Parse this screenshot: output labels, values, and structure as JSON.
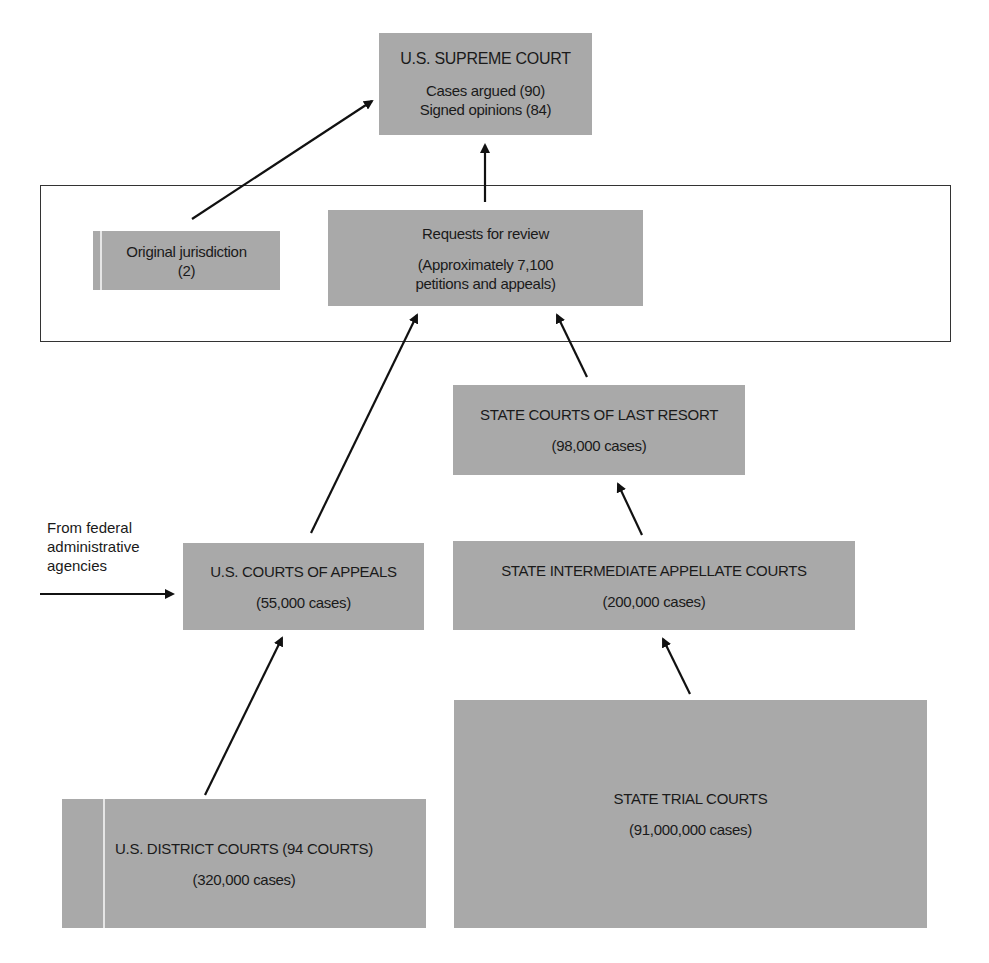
{
  "diagram": {
    "type": "flowchart",
    "nodes": {
      "supreme_court": {
        "title": "U.S. SUPREME COURT",
        "line1": "Cases argued (90)",
        "line2": "Signed opinions (84)"
      },
      "original_jurisdiction": {
        "title": "Original jurisdiction",
        "line1": "(2)"
      },
      "requests_for_review": {
        "title": "Requests for review",
        "line1": "(Approximately 7,100",
        "line2": "petitions and appeals)"
      },
      "state_last_resort": {
        "title": "STATE COURTS OF LAST RESORT",
        "line1": "(98,000 cases)"
      },
      "courts_of_appeals": {
        "title": "U.S. COURTS OF APPEALS",
        "line1": "(55,000 cases)"
      },
      "state_intermediate": {
        "title": "STATE INTERMEDIATE APPELLATE COURTS",
        "line1": "(200,000 cases)"
      },
      "district_courts": {
        "title": "U.S. DISTRICT COURTS (94 COURTS)",
        "line1": "(320,000 cases)"
      },
      "state_trial": {
        "title": "STATE TRIAL COURTS",
        "line1": "(91,000,000 cases)"
      }
    },
    "external_input": {
      "line1": "From federal",
      "line2": "administrative",
      "line3": "agencies"
    },
    "edges": [
      {
        "from": "original_jurisdiction",
        "to": "supreme_court"
      },
      {
        "from": "requests_for_review",
        "to": "supreme_court"
      },
      {
        "from": "courts_of_appeals",
        "to": "requests_for_review"
      },
      {
        "from": "state_last_resort",
        "to": "requests_for_review"
      },
      {
        "from": "state_intermediate",
        "to": "state_last_resort"
      },
      {
        "from": "district_courts",
        "to": "courts_of_appeals"
      },
      {
        "from": "state_trial",
        "to": "state_intermediate"
      },
      {
        "from": "federal_administrative_agencies",
        "to": "courts_of_appeals"
      }
    ],
    "colors": {
      "box_fill": "#a9a9a9",
      "line": "#111111",
      "frame": "#333333"
    }
  }
}
